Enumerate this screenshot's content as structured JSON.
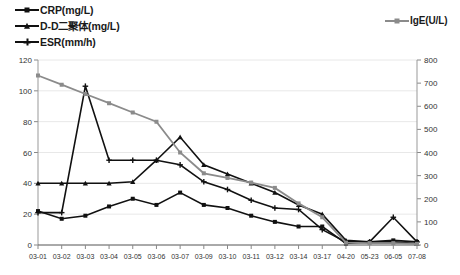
{
  "legend": {
    "left_items": [
      {
        "label": "CRP(mg/L)",
        "marker": "square-marker",
        "color": "#111111"
      },
      {
        "label": "D-D二聚体(mg/L)",
        "marker": "triangle-marker",
        "color": "#111111"
      },
      {
        "label": "ESR(mm/h)",
        "marker": "plus-marker",
        "color": "#111111"
      }
    ],
    "right_items": [
      {
        "label": "IgE(U/L)",
        "marker": "square-marker",
        "color": "#8b8b8b"
      }
    ]
  },
  "axes": {
    "left_ticks": [
      "0",
      "20",
      "40",
      "60",
      "80",
      "100",
      "120"
    ],
    "right_ticks": [
      "0",
      "100",
      "200",
      "300",
      "400",
      "500",
      "600",
      "700",
      "800"
    ],
    "left_min": 0,
    "left_max": 120,
    "right_min": 0,
    "right_max": 800
  },
  "chart_data": {
    "type": "line",
    "title": "",
    "xlabel": "",
    "ylabel": "",
    "y2label": "",
    "grid": true,
    "legend_position": "top",
    "ylim": [
      0,
      120
    ],
    "y2lim": [
      0,
      800
    ],
    "categories": [
      "03-01",
      "03-02",
      "03-03",
      "03-04",
      "03-05",
      "03-06",
      "03-07",
      "03-09",
      "03-10",
      "03-11",
      "03-12",
      "03-14",
      "03-17",
      "04-20",
      "05-23",
      "06-05",
      "07-08"
    ],
    "series": [
      {
        "name": "CRP(mg/L)",
        "axis": "left",
        "color": "#111111",
        "marker": "square",
        "values": [
          22,
          17,
          19,
          25,
          30,
          26,
          34,
          26,
          24,
          19,
          15,
          12,
          12,
          1,
          2,
          3,
          2
        ]
      },
      {
        "name": "D-D二聚体(mg/L)",
        "axis": "left",
        "color": "#111111",
        "marker": "triangle",
        "values": [
          40,
          40,
          40,
          40,
          41,
          55,
          70,
          52,
          46,
          40,
          34,
          26,
          20,
          3,
          2,
          2,
          1
        ]
      },
      {
        "name": "ESR(mm/h)",
        "axis": "left",
        "color": "#111111",
        "marker": "plus",
        "values": [
          21,
          21,
          103,
          55,
          55,
          55,
          52,
          41,
          36,
          29,
          24,
          23,
          10,
          2,
          2,
          18,
          2
        ]
      },
      {
        "name": "IgE(U/L)",
        "axis": "right",
        "color": "#8b8b8b",
        "marker": "square",
        "values": [
          733,
          693,
          653,
          613,
          573,
          533,
          400,
          310,
          290,
          270,
          247,
          180,
          120,
          10,
          8,
          8,
          5
        ]
      }
    ]
  }
}
